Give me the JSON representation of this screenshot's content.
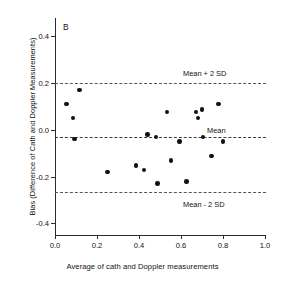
{
  "figure": {
    "panel_letter": "B",
    "background_color": "#ffffff",
    "point_color": "#111111",
    "line_color": "#555555"
  },
  "chart_data": {
    "type": "scatter",
    "title": "B",
    "xlabel": "Average of cath and Doppler measurements",
    "ylabel": "Bias (Difference of Cath and Doppler Measurements)",
    "xlim": [
      0.0,
      1.0
    ],
    "ylim": [
      -0.45,
      0.47
    ],
    "xticks": [
      0.0,
      0.2,
      0.4,
      0.6,
      0.8,
      1.0
    ],
    "xticklabels": [
      "0.0",
      "0.2",
      "0.4",
      "0.6",
      "0.8",
      "1.0"
    ],
    "yticks": [
      0.4,
      0.2,
      0.0,
      -0.2,
      -0.4
    ],
    "yticklabels": [
      "0.4",
      "0.2",
      "0.0",
      "-0.2",
      "-0.4"
    ],
    "grid": false,
    "legend": "none",
    "reference_lines": [
      {
        "name": "upper-limit-of-agreement",
        "label": "Mean + 2 SD",
        "value": 0.2,
        "style": "dashed",
        "label_position": "above-right"
      },
      {
        "name": "mean-bias",
        "label": "Mean",
        "value": -0.03,
        "style": "dashed",
        "label_position": "above-right"
      },
      {
        "name": "lower-limit-of-agreement",
        "label": "Mean - 2 SD",
        "value": -0.265,
        "style": "dashed",
        "label_position": "below-right"
      }
    ],
    "series": [
      {
        "name": "cath-vs-doppler-bias",
        "marker": "filled-circle",
        "points": [
          {
            "x": 0.055,
            "y": 0.11
          },
          {
            "x": 0.085,
            "y": 0.05
          },
          {
            "x": 0.118,
            "y": 0.17
          },
          {
            "x": 0.093,
            "y": -0.04
          },
          {
            "x": 0.25,
            "y": -0.18
          },
          {
            "x": 0.385,
            "y": -0.152
          },
          {
            "x": 0.423,
            "y": -0.172
          },
          {
            "x": 0.44,
            "y": -0.02
          },
          {
            "x": 0.48,
            "y": -0.03
          },
          {
            "x": 0.487,
            "y": -0.23
          },
          {
            "x": 0.533,
            "y": 0.077
          },
          {
            "x": 0.553,
            "y": -0.132
          },
          {
            "x": 0.592,
            "y": -0.05
          },
          {
            "x": 0.625,
            "y": -0.22
          },
          {
            "x": 0.672,
            "y": 0.077
          },
          {
            "x": 0.681,
            "y": 0.05
          },
          {
            "x": 0.7,
            "y": 0.087
          },
          {
            "x": 0.705,
            "y": -0.03
          },
          {
            "x": 0.745,
            "y": -0.112
          },
          {
            "x": 0.778,
            "y": 0.11
          },
          {
            "x": 0.8,
            "y": -0.05
          }
        ]
      }
    ]
  }
}
